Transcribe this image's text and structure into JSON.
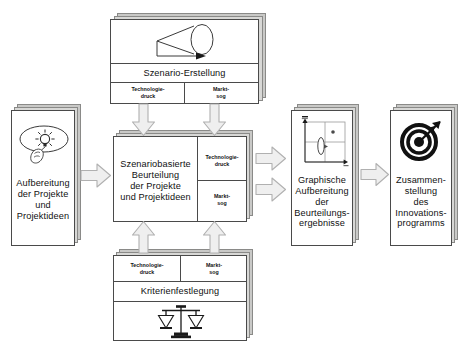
{
  "diagram": {
    "colors": {
      "card_border": "#4a4a4a",
      "card_fill": "#ffffff",
      "stack_fill": "#d8d8d6",
      "arrow_fill": "#efefef",
      "arrow_stroke": "#b4b4b4",
      "text": "#111111"
    },
    "nodes": {
      "input": {
        "label_lines": [
          "Aufbereitung",
          "der Projekte",
          "und",
          "Projektideen"
        ],
        "icon": "lightbulb-thought-bubble-icon"
      },
      "scenario": {
        "label": "Szenario-Erstellung",
        "icon": "scenario-funnel-cone-icon",
        "criteria": [
          {
            "line1": "Technologie-",
            "line2": "druck"
          },
          {
            "line1": "Markt-",
            "line2": "sog"
          }
        ]
      },
      "assessment": {
        "label_lines": [
          "Szenariobasierte",
          "Beurteilung",
          "der  Projekte",
          "und Projektideen"
        ],
        "criteria": [
          {
            "line1": "Technologie-",
            "line2": "druck"
          },
          {
            "line1": "Markt-",
            "line2": "sog"
          }
        ]
      },
      "criteria_definition": {
        "label": "Kriterienfestlegung",
        "icon": "balance-scales-icon",
        "criteria": [
          {
            "line1": "Technologie-",
            "line2": "druck"
          },
          {
            "line1": "Markt-",
            "line2": "sog"
          }
        ]
      },
      "graphics": {
        "label_lines": [
          "Graphische",
          "Aufbereitung",
          "der",
          "Beurteilungs-",
          "ergebnisse"
        ],
        "icon": "portfolio-matrix-chart-icon"
      },
      "program": {
        "label_lines": [
          "Zusammen-",
          "stellung",
          "des",
          "Innovations-",
          "programms"
        ],
        "icon": "bullseye-target-arrow-icon"
      }
    },
    "arrows": [
      {
        "name": "arrow-input-to-assessment",
        "direction": "right"
      },
      {
        "name": "arrow-scenario-to-assessment-left",
        "direction": "down"
      },
      {
        "name": "arrow-scenario-to-assessment-right",
        "direction": "down"
      },
      {
        "name": "arrow-criteria-to-assessment-left",
        "direction": "up"
      },
      {
        "name": "arrow-criteria-to-assessment-right",
        "direction": "up"
      },
      {
        "name": "arrow-assessment-to-graphics-top",
        "direction": "right"
      },
      {
        "name": "arrow-assessment-to-graphics-bottom",
        "direction": "right"
      },
      {
        "name": "arrow-graphics-to-program",
        "direction": "right"
      }
    ]
  }
}
